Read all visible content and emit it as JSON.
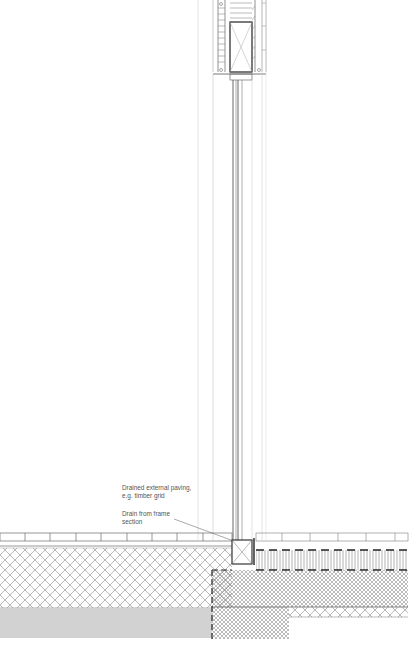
{
  "drawing": {
    "title": "Window sill section detail at external paving",
    "annotations": [
      {
        "id": "paving",
        "lines": [
          "Drained external paving,",
          "e.g. timber grid"
        ]
      },
      {
        "id": "drain",
        "lines": [
          "Drain from frame",
          "section"
        ]
      }
    ],
    "colors": {
      "line": "#3a3a3a",
      "light_line": "#9a9a9a",
      "gray_band": "#d2d2d2",
      "hatch": "#8c8c8c"
    }
  }
}
